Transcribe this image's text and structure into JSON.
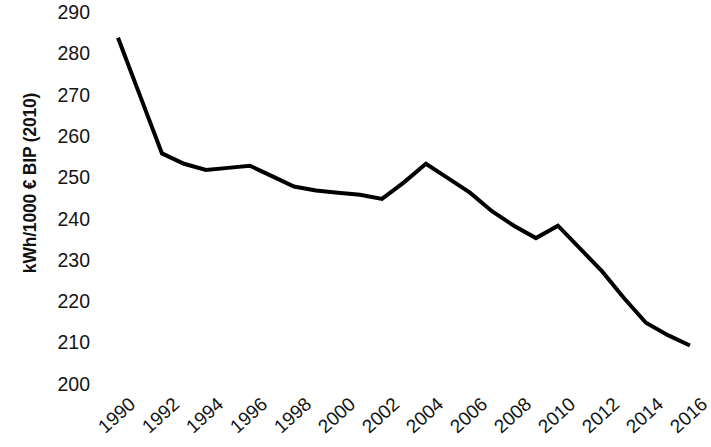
{
  "chart_data": {
    "type": "line",
    "title": "",
    "subtitle": "",
    "xlabel": "",
    "ylabel": "kWh/1000 € BIP (2010)",
    "x": [
      1990,
      1991,
      1992,
      1993,
      1994,
      1995,
      1996,
      1997,
      1998,
      1999,
      2000,
      2001,
      2002,
      2003,
      2004,
      2005,
      2006,
      2007,
      2008,
      2009,
      2010,
      2011,
      2012,
      2013,
      2014,
      2015,
      2016
    ],
    "values": [
      284.0,
      270.0,
      256.0,
      253.5,
      252.0,
      252.5,
      253.0,
      250.5,
      248.0,
      247.0,
      246.5,
      246.0,
      245.0,
      249.0,
      253.5,
      250.0,
      246.5,
      242.0,
      238.5,
      235.5,
      238.5,
      233.0,
      227.5,
      221.0,
      215.0,
      212.0,
      209.5
    ],
    "series": [
      {
        "name": "Energieintensität",
        "values": [
          284.0,
          270.0,
          256.0,
          253.5,
          252.0,
          252.5,
          253.0,
          250.5,
          248.0,
          247.0,
          246.5,
          246.0,
          245.0,
          249.0,
          253.5,
          250.0,
          246.5,
          242.0,
          238.5,
          235.5,
          238.5,
          233.0,
          227.5,
          221.0,
          215.0,
          212.0,
          209.5
        ],
        "color": "#000000"
      }
    ],
    "x_tick_labels": [
      "1990",
      "1992",
      "1994",
      "1996",
      "1998",
      "2000",
      "2002",
      "2004",
      "2006",
      "2008",
      "2010",
      "2012",
      "2014",
      "2016"
    ],
    "x_tick_values": [
      1990,
      1992,
      1994,
      1996,
      1998,
      2000,
      2002,
      2004,
      2006,
      2008,
      2010,
      2012,
      2014,
      2016
    ],
    "y_tick_labels": [
      "290",
      "280",
      "270",
      "260",
      "250",
      "240",
      "230",
      "220",
      "210",
      "200"
    ],
    "y_tick_values": [
      290,
      280,
      270,
      260,
      250,
      240,
      230,
      220,
      210,
      200
    ],
    "ylim": [
      200,
      293
    ],
    "xlim": [
      1990,
      2016.6
    ],
    "grid": false,
    "legend": false,
    "legend_position": "none",
    "markers": false,
    "line_width": 4,
    "line_color": "#000000",
    "background_color": "#ffffff",
    "x_tick_rotation": -42,
    "annotations": []
  }
}
